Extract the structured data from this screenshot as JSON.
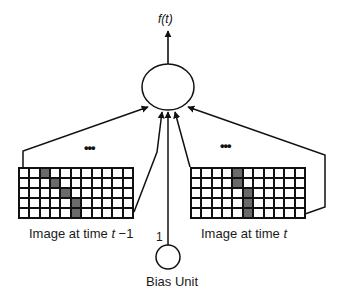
{
  "diagram": {
    "output_label": "f(t)",
    "output_unit": {
      "shape": "circle"
    },
    "bias_unit": {
      "label": "Bias Unit",
      "weight_label": "1"
    },
    "images": [
      {
        "id": "prev",
        "label_prefix": "Image at time ",
        "label_var": "t",
        "label_suffix": " −1",
        "ellipsis": "•••",
        "rows": 5,
        "cols": 11,
        "shaded_cells": [
          [
            0,
            2
          ],
          [
            1,
            3
          ],
          [
            2,
            4
          ],
          [
            3,
            5
          ],
          [
            4,
            5
          ]
        ]
      },
      {
        "id": "curr",
        "label_prefix": "Image at time ",
        "label_var": "t",
        "label_suffix": "",
        "ellipsis": "•••",
        "rows": 5,
        "cols": 11,
        "shaded_cells": [
          [
            0,
            4
          ],
          [
            1,
            4
          ],
          [
            2,
            5
          ],
          [
            3,
            5
          ],
          [
            4,
            5
          ]
        ]
      }
    ],
    "colors": {
      "line": "#111111",
      "shaded": "#6a6a6a",
      "background": "#ffffff"
    }
  }
}
